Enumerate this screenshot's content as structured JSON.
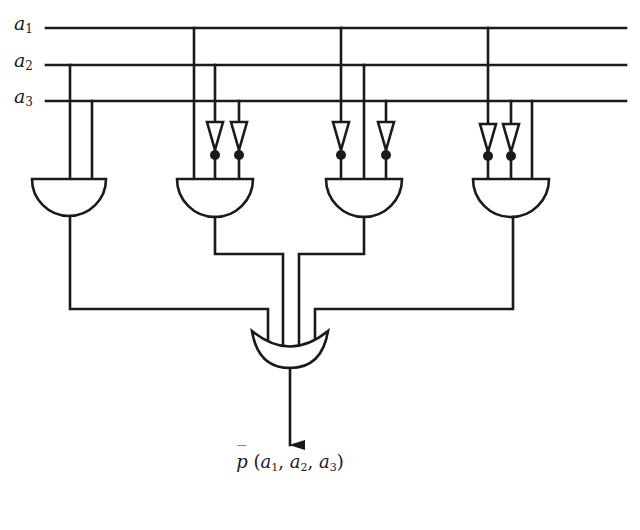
{
  "diagram": {
    "type": "logic-circuit",
    "colors": {
      "ink": "#1a1a1a",
      "background": "#ffffff"
    },
    "inputs": [
      {
        "name": "a",
        "sub": "1",
        "y": 28
      },
      {
        "name": "a",
        "sub": "2",
        "y": 65
      },
      {
        "name": "a",
        "sub": "3",
        "y": 101
      }
    ],
    "and_gates": [
      {
        "id": "and-1",
        "inputs": [
          {
            "line": "a2",
            "inverted": false
          },
          {
            "line": "a3",
            "inverted": false
          }
        ]
      },
      {
        "id": "and-2",
        "inputs": [
          {
            "line": "a1",
            "inverted": false
          },
          {
            "line": "a2",
            "inverted": true
          },
          {
            "line": "a3",
            "inverted": true
          }
        ]
      },
      {
        "id": "and-3",
        "inputs": [
          {
            "line": "a1",
            "inverted": true
          },
          {
            "line": "a2",
            "inverted": false
          },
          {
            "line": "a3",
            "inverted": true
          }
        ]
      },
      {
        "id": "and-4",
        "inputs": [
          {
            "line": "a1",
            "inverted": true
          },
          {
            "line": "a3",
            "inverted": true
          },
          {
            "line": "a3",
            "inverted": false
          }
        ]
      }
    ],
    "or_gate": {
      "id": "or-1",
      "inputs": [
        "and-1",
        "and-2",
        "and-3",
        "and-4"
      ]
    },
    "output": {
      "func": "p",
      "bar": "̄",
      "open": "(",
      "args": [
        {
          "name": "a",
          "sub": "1",
          "sep": ", "
        },
        {
          "name": "a",
          "sub": "2",
          "sep": ", "
        },
        {
          "name": "a",
          "sub": "3",
          "sep": ""
        }
      ],
      "close": ")"
    }
  }
}
